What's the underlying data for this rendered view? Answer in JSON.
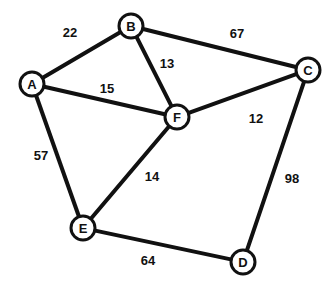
{
  "chart_data": {
    "type": "diagram",
    "diagram_type": "weighted-undirected-graph",
    "title": "",
    "xlabel": "",
    "ylabel": "",
    "grid": false,
    "legend": "none",
    "colors": {
      "background": "#ffffff",
      "stroke": "#111111",
      "node_fill": "#ffffff",
      "text": "#111111"
    },
    "node_radius": 12,
    "edge_stroke_width": 4,
    "nodes": [
      {
        "id": "A",
        "label": "A",
        "x": 32,
        "y": 84
      },
      {
        "id": "B",
        "label": "B",
        "x": 131,
        "y": 26
      },
      {
        "id": "C",
        "label": "C",
        "x": 308,
        "y": 70
      },
      {
        "id": "D",
        "label": "D",
        "x": 243,
        "y": 262
      },
      {
        "id": "E",
        "label": "E",
        "x": 83,
        "y": 228
      },
      {
        "id": "F",
        "label": "F",
        "x": 177,
        "y": 117
      }
    ],
    "edges": [
      {
        "source": "A",
        "target": "B",
        "weight": 22,
        "label": "22",
        "label_x": 70,
        "label_y": 32
      },
      {
        "source": "B",
        "target": "C",
        "weight": 67,
        "label": "67",
        "label_x": 237,
        "label_y": 33
      },
      {
        "source": "B",
        "target": "F",
        "weight": 13,
        "label": "13",
        "label_x": 167,
        "label_y": 63
      },
      {
        "source": "A",
        "target": "F",
        "weight": 15,
        "label": "15",
        "label_x": 107,
        "label_y": 88
      },
      {
        "source": "F",
        "target": "C",
        "weight": 12,
        "label": "12",
        "label_x": 256,
        "label_y": 118
      },
      {
        "source": "A",
        "target": "E",
        "weight": 57,
        "label": "57",
        "label_x": 41,
        "label_y": 155
      },
      {
        "source": "E",
        "target": "F",
        "weight": 14,
        "label": "14",
        "label_x": 152,
        "label_y": 176
      },
      {
        "source": "C",
        "target": "D",
        "weight": 98,
        "label": "98",
        "label_x": 292,
        "label_y": 178
      },
      {
        "source": "E",
        "target": "D",
        "weight": 64,
        "label": "64",
        "label_x": 148,
        "label_y": 260
      }
    ]
  }
}
